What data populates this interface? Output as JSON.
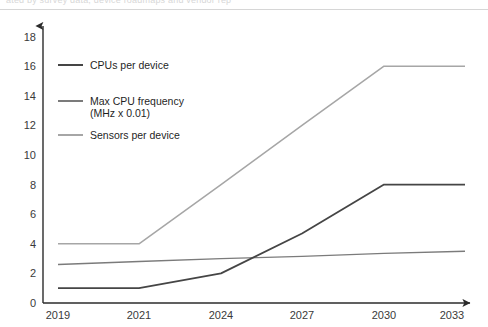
{
  "top_strip": {
    "partial_text": "ated by survey data, device roadmaps and vendor rep"
  },
  "chart_data": {
    "type": "line",
    "title": "",
    "xlabel": "",
    "ylabel": "",
    "x": [
      "2019",
      "2021",
      "2024",
      "2027",
      "2030",
      "2033"
    ],
    "categories": [
      "2019",
      "2021",
      "2024",
      "2027",
      "2030",
      "2033"
    ],
    "xtick_labels": [
      "2019",
      "2021",
      "2024",
      "2027",
      "2030",
      "2033"
    ],
    "ytick_labels": [
      "0",
      "2",
      "4",
      "6",
      "8",
      "10",
      "12",
      "14",
      "16",
      "18"
    ],
    "ylim": [
      0,
      18
    ],
    "ytick_step": 2,
    "grid": false,
    "legend_position": "inside-upper-left",
    "series": [
      {
        "name": "CPUs per device",
        "color": "#454545",
        "width": 1.8,
        "values": [
          1,
          1,
          2,
          4.7,
          8,
          8
        ]
      },
      {
        "name": "Max CPU frequency (MHz x 0.01)",
        "color": "#7b7b7b",
        "width": 1.4,
        "values": [
          2.6,
          2.8,
          3.0,
          3.15,
          3.35,
          3.5
        ]
      },
      {
        "name": "Sensors per device",
        "color": "#a6a6a6",
        "width": 1.5,
        "values": [
          4,
          4,
          8,
          12,
          16,
          16
        ]
      }
    ]
  },
  "legend": {
    "entries": [
      {
        "label": "CPUs per device",
        "label2": "",
        "color": "#454545"
      },
      {
        "label": "Max CPU frequency",
        "label2": "(MHz x 0.01)",
        "color": "#7b7b7b"
      },
      {
        "label": "Sensors per device",
        "label2": "",
        "color": "#a6a6a6"
      }
    ]
  },
  "axes": {
    "x_axis_name": "x-axis",
    "y_axis_name": "y-axis"
  }
}
